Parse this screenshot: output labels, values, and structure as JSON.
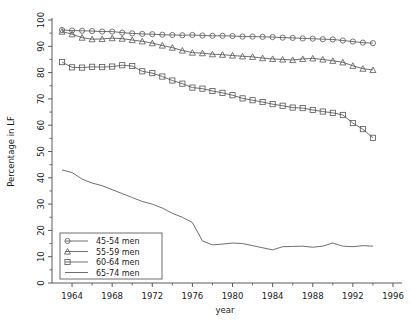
{
  "chart_data": {
    "type": "line",
    "title": "",
    "xlabel": "year",
    "ylabel": "Percentage in LF",
    "xlim": [
      1962,
      1996.5
    ],
    "ylim": [
      0,
      100
    ],
    "xticks": [
      1964,
      1968,
      1972,
      1976,
      1980,
      1984,
      1988,
      1992,
      1996
    ],
    "xticklabels": [
      "1964",
      "1968",
      "1972",
      "1976",
      "1980",
      "1984",
      "1988",
      "1992",
      "1996"
    ],
    "yticks": [
      0,
      10,
      20,
      30,
      40,
      50,
      60,
      70,
      80,
      90,
      100
    ],
    "yticklabels": [
      "0",
      "10",
      "20",
      "30",
      "40",
      "50",
      "60",
      "70",
      "80",
      "90",
      "100"
    ],
    "minor_ticks": true,
    "grid": false,
    "legend_position": "lower left",
    "x": [
      1963,
      1964,
      1965,
      1966,
      1967,
      1968,
      1969,
      1970,
      1971,
      1972,
      1973,
      1974,
      1975,
      1976,
      1977,
      1978,
      1979,
      1980,
      1981,
      1982,
      1983,
      1984,
      1985,
      1986,
      1987,
      1988,
      1989,
      1990,
      1991,
      1992,
      1993,
      1994
    ],
    "series": [
      {
        "name": "45-54 men",
        "marker": "circle",
        "values": [
          96.2,
          96.0,
          95.9,
          95.8,
          95.6,
          95.6,
          95.2,
          94.9,
          94.7,
          94.6,
          94.4,
          94.3,
          94.2,
          94.3,
          94.1,
          94.0,
          94.0,
          93.9,
          93.7,
          93.7,
          93.6,
          93.5,
          93.3,
          93.2,
          93.0,
          92.9,
          92.7,
          92.6,
          92.2,
          91.8,
          91.4,
          91.2
        ]
      },
      {
        "name": "55-59 men",
        "marker": "triangle",
        "values": [
          95.6,
          94.6,
          93.3,
          92.7,
          92.8,
          93.1,
          92.9,
          92.4,
          91.9,
          91.2,
          90.3,
          89.5,
          88.4,
          87.6,
          87.4,
          87.0,
          86.8,
          86.5,
          86.2,
          86.0,
          85.5,
          85.2,
          85.0,
          84.8,
          85.2,
          85.4,
          85.0,
          84.5,
          83.9,
          82.6,
          81.5,
          81.0
        ]
      },
      {
        "name": "60-64 men",
        "marker": "square",
        "values": [
          84.0,
          82.0,
          81.9,
          82.2,
          82.1,
          82.3,
          82.8,
          82.5,
          80.5,
          79.8,
          78.5,
          77.0,
          75.8,
          74.3,
          73.9,
          73.0,
          72.3,
          71.4,
          70.2,
          69.5,
          68.8,
          68.0,
          67.4,
          66.7,
          66.5,
          65.8,
          65.2,
          64.7,
          63.9,
          60.8,
          58.5,
          55.2
        ]
      },
      {
        "name": "65-74 men",
        "marker": "none",
        "values": [
          43.0,
          42.0,
          39.5,
          38.0,
          37.0,
          35.5,
          34.0,
          32.5,
          31.0,
          30.0,
          28.5,
          26.5,
          25.0,
          23.0,
          16.0,
          14.5,
          14.8,
          15.2,
          15.0,
          14.2,
          13.4,
          12.6,
          13.8,
          13.9,
          14.0,
          13.6,
          14.0,
          15.2,
          14.0,
          13.8,
          14.2,
          14.0
        ]
      }
    ]
  },
  "legend": {
    "items": [
      {
        "label": "45-54 men",
        "marker": "circle"
      },
      {
        "label": "55-59 men",
        "marker": "triangle"
      },
      {
        "label": "60-64 men",
        "marker": "square"
      },
      {
        "label": "65-74 men",
        "marker": "none"
      }
    ]
  },
  "caption": {
    "text": ""
  },
  "colors": {
    "axis": "#4a4a4a",
    "line": "#555555",
    "text": "#1a1a1a",
    "background": "#ffffff"
  }
}
